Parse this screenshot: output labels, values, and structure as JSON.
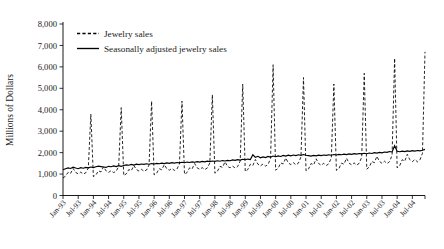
{
  "chart_data": {
    "type": "line",
    "title": "",
    "xlabel": "",
    "ylabel": "Millions of Dollars",
    "ylim": [
      0,
      8000
    ],
    "ytick_labels": [
      "0",
      "1,000",
      "2,000",
      "3,000",
      "4,000",
      "5,000",
      "6,000",
      "7,000",
      "8,000"
    ],
    "ytick_values": [
      0,
      1000,
      2000,
      3000,
      4000,
      5000,
      6000,
      7000,
      8000
    ],
    "xtick_labels": [
      "Jan-93",
      "Jul-93",
      "Jan-94",
      "Jul-94",
      "Jan-95",
      "Jul-95",
      "Jan-96",
      "Jul-96",
      "Jan-97",
      "Jul-97",
      "Jan-98",
      "Jul-98",
      "Jan-99",
      "Jul-99",
      "Jan-00",
      "Jul-00",
      "Jan-01",
      "Jul-01",
      "Jan-02",
      "Jul-02",
      "Jan-03",
      "Jul-03",
      "Jan-04",
      "Jul-04"
    ],
    "grid": false,
    "legend_position": "top-left",
    "legend": [
      "Jewelry sales",
      "Seasonally adjusted jewelry sales"
    ],
    "x_start": "Jan-93",
    "x_end": "Dec-04",
    "x_interval": "monthly",
    "n_points": 144,
    "series": [
      {
        "name": "Jewelry sales",
        "style": "dashed",
        "color": "#000000",
        "values": [
          820,
          900,
          1080,
          1030,
          1260,
          1080,
          1010,
          1090,
          1000,
          1060,
          1280,
          3800,
          880,
          960,
          1150,
          1100,
          1340,
          1150,
          1080,
          1160,
          1070,
          1130,
          1360,
          4100,
          930,
          1010,
          1210,
          1160,
          1400,
          1210,
          1140,
          1220,
          1130,
          1190,
          1420,
          4400,
          960,
          1040,
          1250,
          1200,
          1440,
          1250,
          1180,
          1260,
          1170,
          1230,
          1470,
          4400,
          990,
          1070,
          1290,
          1240,
          1490,
          1290,
          1220,
          1300,
          1210,
          1280,
          1520,
          4700,
          1040,
          1130,
          1360,
          1310,
          1570,
          1360,
          1290,
          1370,
          1280,
          1350,
          1610,
          5200,
          1120,
          1210,
          1460,
          1400,
          1680,
          1460,
          1380,
          1470,
          1370,
          1450,
          1730,
          6100,
          1180,
          1270,
          1520,
          1470,
          1750,
          1520,
          1440,
          1530,
          1430,
          1510,
          1800,
          5500,
          1150,
          1240,
          1490,
          1430,
          1710,
          1490,
          1410,
          1500,
          1400,
          1480,
          1760,
          5200,
          1170,
          1260,
          1510,
          1460,
          1740,
          1510,
          1430,
          1520,
          1420,
          1500,
          1790,
          5700,
          1230,
          1330,
          1590,
          1530,
          1830,
          1590,
          1500,
          1600,
          1490,
          1580,
          1880,
          6400,
          1290,
          1390,
          1670,
          1600,
          1920,
          1670,
          1580,
          1680,
          1570,
          1660,
          1970,
          6700
        ]
      },
      {
        "name": "Seasonally adjusted jewelry sales",
        "style": "solid",
        "color": "#000000",
        "values": [
          1200,
          1250,
          1290,
          1260,
          1320,
          1280,
          1250,
          1300,
          1270,
          1310,
          1290,
          1330,
          1300,
          1340,
          1370,
          1350,
          1330,
          1310,
          1360,
          1340,
          1380,
          1350,
          1390,
          1360,
          1400,
          1430,
          1410,
          1450,
          1420,
          1460,
          1440,
          1470,
          1450,
          1480,
          1460,
          1490,
          1470,
          1500,
          1480,
          1510,
          1490,
          1520,
          1500,
          1530,
          1510,
          1540,
          1520,
          1550,
          1530,
          1560,
          1540,
          1570,
          1550,
          1580,
          1560,
          1590,
          1570,
          1600,
          1580,
          1610,
          1590,
          1620,
          1600,
          1630,
          1610,
          1640,
          1620,
          1660,
          1640,
          1670,
          1650,
          1690,
          1670,
          1700,
          1680,
          1900,
          1780,
          1830,
          1760,
          1800,
          1770,
          1820,
          1790,
          1840,
          1810,
          1850,
          1820,
          1870,
          1840,
          1880,
          1850,
          1890,
          1860,
          1900,
          1870,
          1910,
          1880,
          1860,
          1840,
          1870,
          1850,
          1880,
          1860,
          1890,
          1870,
          1900,
          1880,
          1910,
          1890,
          1920,
          1900,
          1930,
          1910,
          1940,
          1920,
          1950,
          1930,
          1960,
          1940,
          1970,
          1950,
          1980,
          1960,
          2000,
          1980,
          2010,
          1990,
          2030,
          2010,
          2050,
          2030,
          2320,
          2060,
          2040,
          2070,
          2050,
          2080,
          2060,
          2090,
          2070,
          2100,
          2080,
          2110,
          2150
        ]
      }
    ]
  },
  "legend": {
    "items": [
      {
        "label": "Jewelry sales",
        "style": "dashed"
      },
      {
        "label": "Seasonally adjusted jewelry sales",
        "style": "solid"
      }
    ]
  }
}
